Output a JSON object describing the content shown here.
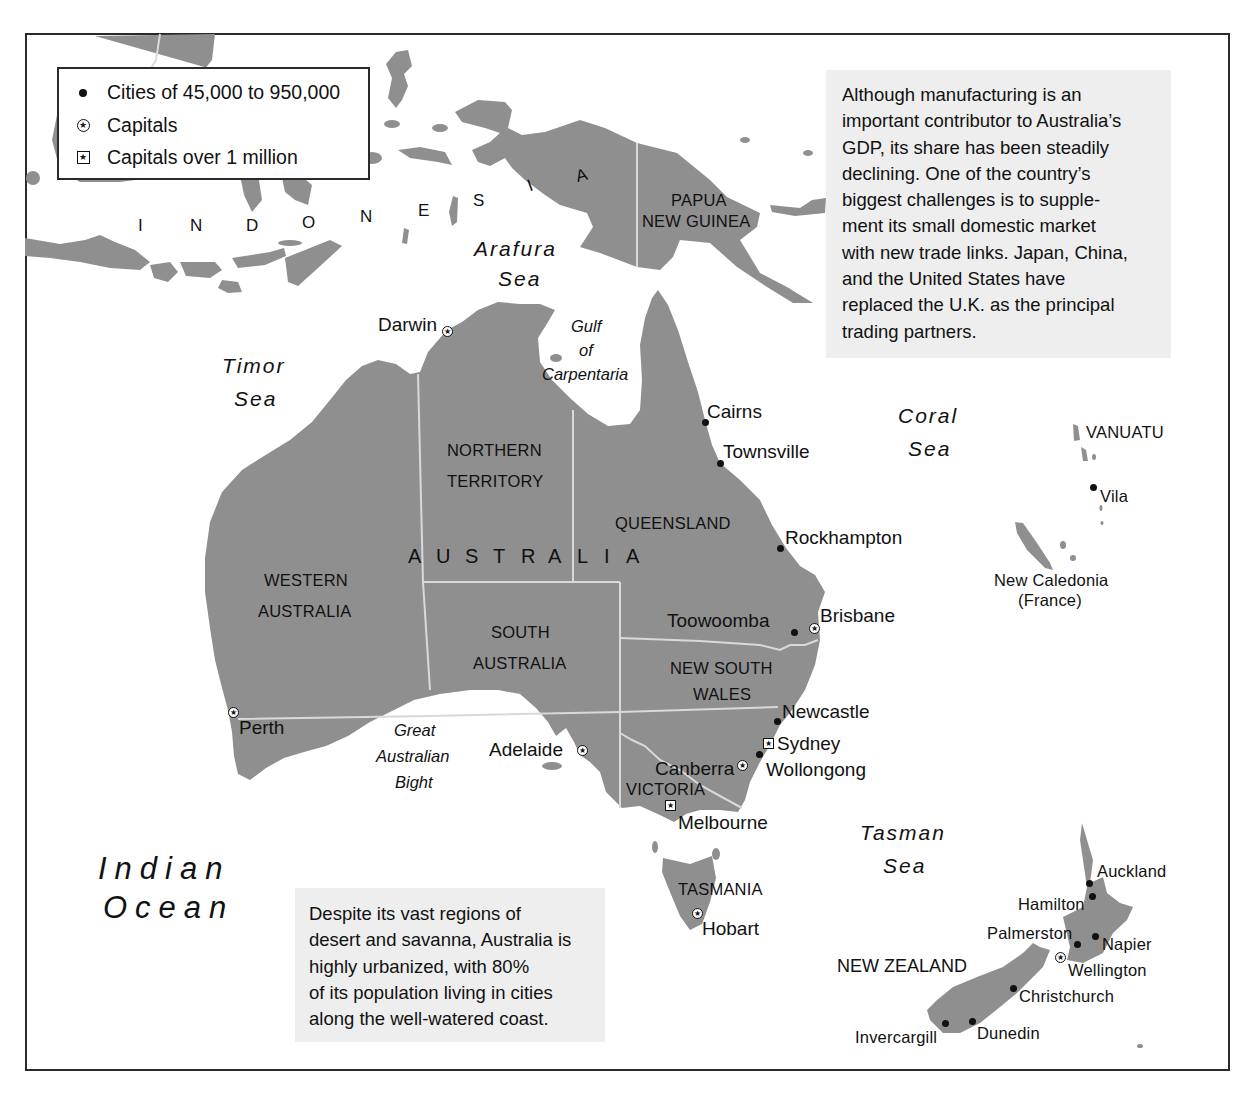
{
  "legend": {
    "items": [
      {
        "icon": "city-dot-icon",
        "label": "Cities of 45,000 to 950,000"
      },
      {
        "icon": "capital-circle-star-icon",
        "label": "Capitals"
      },
      {
        "icon": "capital-square-star-icon",
        "label": "Capitals over 1 million"
      }
    ],
    "symbols": {
      "star": "★"
    }
  },
  "notes": {
    "manufacturing": [
      "Although manufacturing is an",
      "important contributor to Australia’s",
      "GDP, its share has been steadily",
      "declining. One of the country’s",
      "biggest challenges is to supple-",
      "ment its small domestic market",
      "with new trade links. Japan, China,",
      "and the United States have",
      "replaced the U.K. as the principal",
      "trading partners."
    ],
    "urbanization": [
      "Despite its vast regions of",
      "desert and savanna, Australia is",
      "highly urbanized, with 80%",
      "of its population living in cities",
      "along the well-watered coast."
    ]
  },
  "water_bodies": {
    "arafura": [
      "Arafura",
      "Sea"
    ],
    "timor": [
      "Timor",
      "Sea"
    ],
    "gulf": [
      "Gulf",
      "of",
      "Carpentaria"
    ],
    "coral": [
      "Coral",
      "Sea"
    ],
    "tasman": [
      "Tasman",
      "Sea"
    ],
    "indian": [
      "Indian",
      "Ocean"
    ],
    "bight": [
      "Great",
      "Australian",
      "Bight"
    ]
  },
  "countries": {
    "indonesia": {
      "letters": [
        "I",
        "N",
        "D",
        "O",
        "N",
        "E",
        "S",
        "I",
        "A"
      ]
    },
    "australia": {
      "letters": [
        "A",
        "U",
        "S",
        "T",
        "R",
        "A",
        "L",
        "I",
        "A"
      ]
    },
    "papua_new_guinea": [
      "PAPUA",
      "NEW GUINEA"
    ],
    "new_zealand": "NEW ZEALAND",
    "vanuatu": "VANUATU",
    "new_caledonia": [
      "New Caledonia",
      "(France)"
    ]
  },
  "states": {
    "northern_territory": [
      "NORTHERN",
      "TERRITORY"
    ],
    "queensland": "QUEENSLAND",
    "western_australia": [
      "WESTERN",
      "AUSTRALIA"
    ],
    "south_australia": [
      "SOUTH",
      "AUSTRALIA"
    ],
    "new_south_wales": [
      "NEW SOUTH",
      "WALES"
    ],
    "victoria": "VICTORIA",
    "tasmania": "TASMANIA"
  },
  "cities": {
    "darwin": {
      "name": "Darwin",
      "type": "capital"
    },
    "cairns": {
      "name": "Cairns",
      "type": "city"
    },
    "townsville": {
      "name": "Townsville",
      "type": "city"
    },
    "rockhampton": {
      "name": "Rockhampton",
      "type": "city"
    },
    "toowoomba": {
      "name": "Toowoomba",
      "type": "city"
    },
    "brisbane": {
      "name": "Brisbane",
      "type": "capital"
    },
    "newcastle": {
      "name": "Newcastle",
      "type": "city"
    },
    "sydney": {
      "name": "Sydney",
      "type": "capital_over_1m"
    },
    "wollongong": {
      "name": "Wollongong",
      "type": "city"
    },
    "canberra": {
      "name": "Canberra",
      "type": "capital"
    },
    "melbourne": {
      "name": "Melbourne",
      "type": "capital_over_1m"
    },
    "adelaide": {
      "name": "Adelaide",
      "type": "capital"
    },
    "perth": {
      "name": "Perth",
      "type": "capital"
    },
    "hobart": {
      "name": "Hobart",
      "type": "capital"
    },
    "vila": {
      "name": "Vila",
      "type": "city"
    },
    "auckland": {
      "name": "Auckland",
      "type": "city"
    },
    "hamilton": {
      "name": "Hamilton",
      "type": "city"
    },
    "palmerston": {
      "name": "Palmerston",
      "type": "city"
    },
    "napier": {
      "name": "Napier",
      "type": "city"
    },
    "wellington": {
      "name": "Wellington",
      "type": "capital"
    },
    "christchurch": {
      "name": "Christchurch",
      "type": "city"
    },
    "dunedin": {
      "name": "Dunedin",
      "type": "city"
    },
    "invercargill": {
      "name": "Invercargill",
      "type": "city"
    }
  },
  "colors": {
    "land": "#8f8f8f",
    "water": "#ffffff",
    "note_bg": "#eeeeee",
    "border": "#d9d9d9"
  }
}
